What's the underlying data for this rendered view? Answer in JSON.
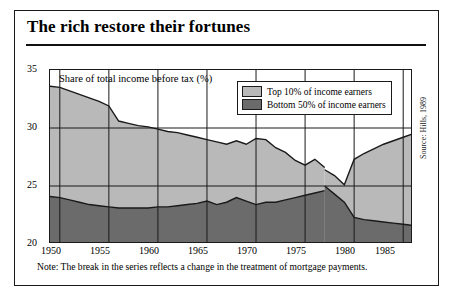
{
  "figure": {
    "title": "The rich restore their fortunes",
    "note": "Note: The break in the series reflects a change in the treatment of mortgage payments.",
    "source": "Source: Hills, 1989"
  },
  "colors": {
    "top_area": "#b9b9b9",
    "bottom_area": "#6b6b6b",
    "line": "#1a1a1a",
    "grid": "#1a1a1a",
    "frame": "#1a1a1a",
    "background": "#ffffff"
  },
  "chart_data": {
    "type": "area",
    "title": "The rich restore their fortunes",
    "subtitle": "Share of total income before tax (%)",
    "xlabel": "",
    "ylabel": "Share of total income before tax (%)",
    "xlim": [
      1949,
      1986
    ],
    "ylim": [
      20,
      35
    ],
    "yticks": [
      20,
      25,
      30,
      35
    ],
    "xticks": [
      1950,
      1955,
      1960,
      1965,
      1970,
      1975,
      1980,
      1985
    ],
    "grid": true,
    "legend_position": "top-right",
    "break_year": 1977,
    "break_note": "The break in the series reflects a change in the treatment of mortgage payments.",
    "series": [
      {
        "name": "Top 10% of income earners",
        "color": "#b9b9b9",
        "x": [
          1949,
          1950,
          1951,
          1952,
          1953,
          1954,
          1955,
          1956,
          1957,
          1958,
          1959,
          1960,
          1961,
          1962,
          1963,
          1964,
          1965,
          1966,
          1967,
          1968,
          1969,
          1970,
          1971,
          1972,
          1973,
          1974,
          1975,
          1976,
          1977,
          1977,
          1978,
          1979,
          1980,
          1981,
          1982,
          1983,
          1984,
          1985,
          1986
        ],
        "values": [
          33.6,
          33.5,
          33.2,
          32.9,
          32.6,
          32.3,
          31.9,
          30.6,
          30.4,
          30.2,
          30.1,
          29.9,
          29.7,
          29.6,
          29.4,
          29.2,
          29.0,
          28.8,
          28.6,
          28.9,
          28.6,
          29.1,
          29.0,
          28.3,
          27.9,
          27.2,
          26.8,
          27.3,
          26.6,
          26.4,
          25.9,
          25.1,
          27.3,
          27.8,
          28.2,
          28.6,
          28.9,
          29.2,
          29.5
        ]
      },
      {
        "name": "Bottom 50% of income earners",
        "color": "#6b6b6b",
        "x": [
          1949,
          1950,
          1951,
          1952,
          1953,
          1954,
          1955,
          1956,
          1957,
          1958,
          1959,
          1960,
          1961,
          1962,
          1963,
          1964,
          1965,
          1966,
          1967,
          1968,
          1969,
          1970,
          1971,
          1972,
          1973,
          1974,
          1975,
          1976,
          1977,
          1977,
          1978,
          1979,
          1980,
          1981,
          1982,
          1983,
          1984,
          1985,
          1986
        ],
        "values": [
          24.1,
          24.0,
          23.8,
          23.6,
          23.4,
          23.3,
          23.2,
          23.1,
          23.1,
          23.1,
          23.1,
          23.2,
          23.2,
          23.3,
          23.4,
          23.5,
          23.7,
          23.4,
          23.6,
          24.0,
          23.7,
          23.4,
          23.6,
          23.6,
          23.8,
          24.0,
          24.2,
          24.4,
          24.6,
          25.0,
          24.3,
          23.6,
          22.3,
          22.1,
          22.0,
          21.9,
          21.8,
          21.7,
          21.6
        ]
      }
    ]
  },
  "axis": {
    "label": "Share of total income before tax (%)",
    "yticks": [
      "35",
      "30",
      "25",
      "20"
    ],
    "xticks": [
      "1950",
      "1955",
      "1960",
      "1965",
      "1970",
      "1975",
      "1980",
      "1985"
    ]
  },
  "legend": {
    "items": [
      {
        "label": "Top 10% of income earners",
        "color": "#b9b9b9"
      },
      {
        "label": "Bottom 50% of income earners",
        "color": "#6b6b6b"
      }
    ]
  }
}
